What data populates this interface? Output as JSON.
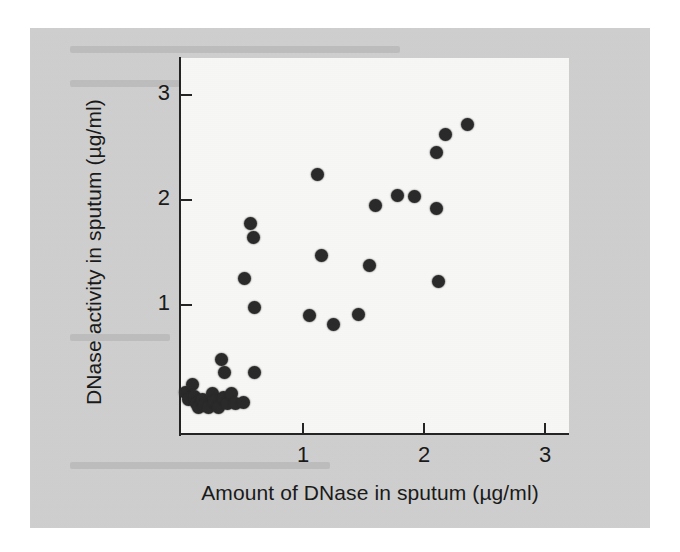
{
  "figure": {
    "background_color": "#cfcfcf",
    "panel_color": "#f7f7f5",
    "axis_color": "#242424",
    "marker_color": "#2a2a2a"
  },
  "chart_data": {
    "type": "scatter",
    "title": "",
    "xlabel": "Amount of DNase in sputum (µg/ml)",
    "ylabel": "DNase activity in sputum (µg/ml)",
    "xlim": [
      0,
      3.2
    ],
    "ylim": [
      0,
      3.55
    ],
    "xticks": [
      1,
      2,
      3
    ],
    "yticks": [
      1,
      2,
      3
    ],
    "xticklabels": [
      "1",
      "2",
      "3"
    ],
    "yticklabels": [
      "1",
      "2",
      "3"
    ],
    "grid": false,
    "legend": null,
    "marker": "filled-circle",
    "n_points": 38,
    "points": [
      {
        "x": 0.03,
        "y": 0.17
      },
      {
        "x": 0.05,
        "y": 0.1
      },
      {
        "x": 0.09,
        "y": 0.24
      },
      {
        "x": 0.1,
        "y": 0.13
      },
      {
        "x": 0.12,
        "y": 0.06
      },
      {
        "x": 0.14,
        "y": 0.02
      },
      {
        "x": 0.17,
        "y": 0.1
      },
      {
        "x": 0.19,
        "y": 0.04
      },
      {
        "x": 0.22,
        "y": 0.02
      },
      {
        "x": 0.25,
        "y": 0.16
      },
      {
        "x": 0.27,
        "y": 0.08
      },
      {
        "x": 0.3,
        "y": 0.02
      },
      {
        "x": 0.33,
        "y": 0.48
      },
      {
        "x": 0.34,
        "y": 0.12
      },
      {
        "x": 0.35,
        "y": 0.36
      },
      {
        "x": 0.38,
        "y": 0.06
      },
      {
        "x": 0.41,
        "y": 0.16
      },
      {
        "x": 0.44,
        "y": 0.06
      },
      {
        "x": 0.51,
        "y": 0.07
      },
      {
        "x": 0.57,
        "y": 1.78
      },
      {
        "x": 0.59,
        "y": 1.64
      },
      {
        "x": 0.6,
        "y": 0.36
      },
      {
        "x": 0.52,
        "y": 1.25
      },
      {
        "x": 0.6,
        "y": 0.98
      },
      {
        "x": 1.05,
        "y": 0.9
      },
      {
        "x": 1.12,
        "y": 2.24
      },
      {
        "x": 1.15,
        "y": 1.47
      },
      {
        "x": 1.25,
        "y": 0.81
      },
      {
        "x": 1.46,
        "y": 0.91
      },
      {
        "x": 1.55,
        "y": 1.38
      },
      {
        "x": 1.6,
        "y": 1.95
      },
      {
        "x": 1.78,
        "y": 2.04
      },
      {
        "x": 1.92,
        "y": 2.03
      },
      {
        "x": 2.1,
        "y": 1.92
      },
      {
        "x": 2.12,
        "y": 1.22
      },
      {
        "x": 2.1,
        "y": 2.45
      },
      {
        "x": 2.18,
        "y": 2.62
      },
      {
        "x": 2.36,
        "y": 2.72
      }
    ]
  }
}
